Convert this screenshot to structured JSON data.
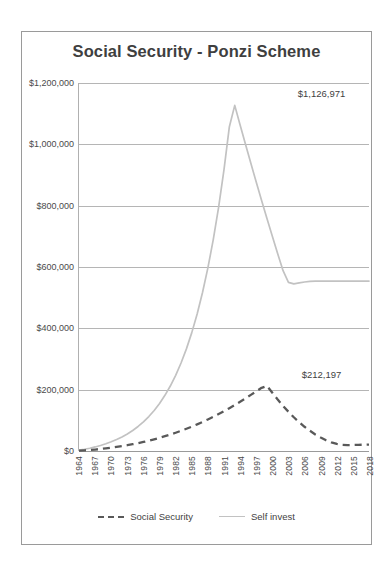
{
  "chart_data": {
    "type": "line",
    "title": "Social Security - Ponzi Scheme",
    "xlabel": "",
    "ylabel": "",
    "ylim": [
      0,
      1200000
    ],
    "ytick_labels": [
      "$0",
      "$200,000",
      "$400,000",
      "$600,000",
      "$800,000",
      "$1,000,000",
      "$1,200,000"
    ],
    "ytick_values": [
      0,
      200000,
      400000,
      600000,
      800000,
      1000000,
      1200000
    ],
    "grid": true,
    "legend_position": "bottom",
    "x": [
      1964,
      1965,
      1966,
      1967,
      1968,
      1969,
      1970,
      1971,
      1972,
      1973,
      1974,
      1975,
      1976,
      1977,
      1978,
      1979,
      1980,
      1981,
      1982,
      1983,
      1984,
      1985,
      1986,
      1987,
      1988,
      1989,
      1990,
      1991,
      1992,
      1993,
      1994,
      1995,
      1996,
      1997,
      1998,
      1999,
      2000,
      2001,
      2002,
      2003,
      2004,
      2005,
      2006,
      2007,
      2008,
      2009,
      2010,
      2011,
      2012,
      2013,
      2014,
      2015,
      2016,
      2017,
      2018
    ],
    "xtick_labels": [
      "1964",
      "1967",
      "1970",
      "1973",
      "1976",
      "1979",
      "1982",
      "1985",
      "1988",
      "1991",
      "1994",
      "1997",
      "2000",
      "2003",
      "2006",
      "2009",
      "2012",
      "2015",
      "2018"
    ],
    "series": [
      {
        "name": "Social Security",
        "style": "dashed",
        "color": "#595959",
        "values": [
          900,
          2000,
          3300,
          4800,
          6500,
          8500,
          10800,
          13200,
          15900,
          18900,
          22200,
          25700,
          29500,
          33700,
          38200,
          43000,
          48200,
          53700,
          59600,
          65900,
          72500,
          79500,
          86900,
          94700,
          102900,
          111500,
          120500,
          129900,
          139700,
          149900,
          160500,
          171500,
          182900,
          194700,
          206000,
          212197,
          190000,
          168000,
          147000,
          128000,
          110000,
          94000,
          79000,
          66000,
          54000,
          44000,
          35000,
          28000,
          23000,
          20000,
          19000,
          19500,
          20000,
          20500,
          21000
        ],
        "peak_label": "$212,197",
        "peak_year": 2009,
        "peak_value": 212197
      },
      {
        "name": "Self invest",
        "style": "solid",
        "color": "#c2c2c2",
        "values": [
          2600,
          5600,
          9100,
          13200,
          18000,
          23600,
          30000,
          37400,
          45900,
          55700,
          67000,
          80000,
          95000,
          112300,
          132200,
          155100,
          181500,
          211900,
          246800,
          286900,
          333000,
          386000,
          446800,
          516700,
          597000,
          689300,
          795400,
          917300,
          1057400,
          1126971,
          1063000,
          1000000,
          938000,
          877000,
          817000,
          758000,
          700000,
          643000,
          588000,
          550000,
          545000,
          548000,
          551000,
          553000,
          554000,
          554000,
          554000,
          554000,
          554000,
          554000,
          554000,
          554000,
          554000,
          554000,
          554000
        ],
        "peak_label": "$1,126,971",
        "peak_year": 2009,
        "peak_value": 1126971
      }
    ],
    "annotations": [
      {
        "text": "$1,126,971",
        "series": "Self invest",
        "at_year": 2009,
        "value": 1126971
      },
      {
        "text": "$212,197",
        "series": "Social Security",
        "at_year": 2009,
        "value": 212197
      }
    ],
    "legend": [
      {
        "label": "Social Security",
        "style": "dashed",
        "color": "#595959"
      },
      {
        "label": "Self invest",
        "style": "solid",
        "color": "#c2c2c2"
      }
    ]
  }
}
